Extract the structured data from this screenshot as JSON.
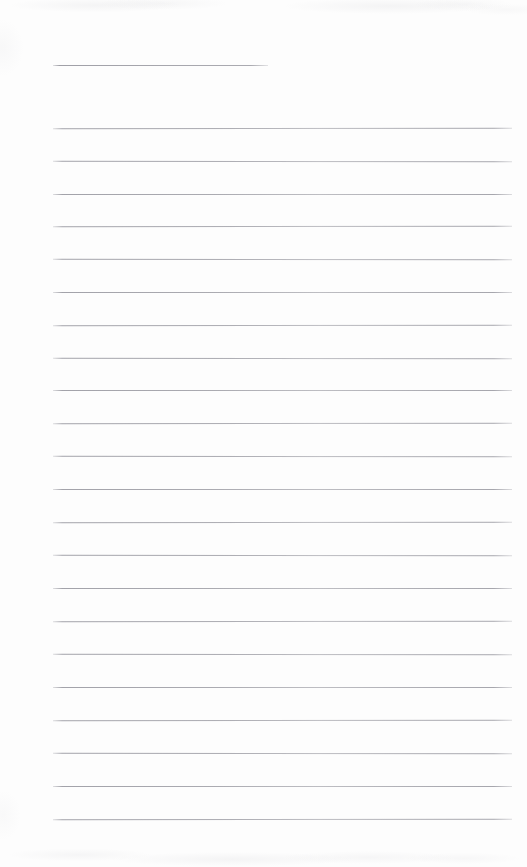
{
  "document": {
    "type": "scanned-lined-page",
    "kind": "blank ruled writing page",
    "text_content": "",
    "page_width": 527,
    "page_height": 867,
    "background_color": "#fdfdfd",
    "rule_color": "#96969e",
    "has_text": false,
    "has_vertical_margin_rule": false,
    "has_page_number": false,
    "has_header_text": false,
    "has_footer_text": false
  },
  "header_rule": {
    "label": "short header rule",
    "x": 53,
    "y": 65,
    "width": 215,
    "thickness": 1
  },
  "body_rules": {
    "label": "ruled writing lines",
    "count": 22,
    "x": 53,
    "width": 459,
    "first_y": 128,
    "spacing": 32.9,
    "thickness": 1,
    "y_positions": [
      128,
      161,
      194,
      226,
      259,
      292,
      325,
      358,
      390,
      423,
      456,
      489,
      522,
      555,
      588,
      621,
      654,
      687,
      720,
      753,
      786,
      819
    ]
  },
  "margins": {
    "left": 53,
    "right": 15,
    "top": 65,
    "bottom": 48
  }
}
